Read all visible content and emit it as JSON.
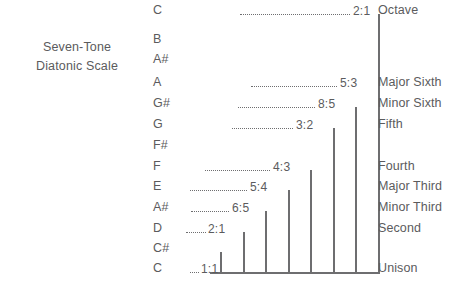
{
  "title": {
    "line1": "Seven-Tone",
    "line2": "Diatonic Scale"
  },
  "colors": {
    "ink": "#5b5b5d",
    "line": "#6e6e70",
    "background": "#ffffff"
  },
  "notes": [
    {
      "label": "C",
      "y": 14
    },
    {
      "label": "B",
      "y": 43
    },
    {
      "label": "A#",
      "y": 63
    },
    {
      "label": "A",
      "y": 86
    },
    {
      "label": "G#",
      "y": 107
    },
    {
      "label": "G",
      "y": 128
    },
    {
      "label": "F#",
      "y": 149
    },
    {
      "label": "F",
      "y": 170
    },
    {
      "label": "E",
      "y": 190
    },
    {
      "label": "A#",
      "y": 211
    },
    {
      "label": "D",
      "y": 232
    },
    {
      "label": "C#",
      "y": 252
    },
    {
      "label": "C",
      "y": 272
    }
  ],
  "intervals": [
    {
      "label": "Octave",
      "y": 14
    },
    {
      "label": "Major Sixth",
      "y": 86
    },
    {
      "label": "Minor Sixth",
      "y": 107
    },
    {
      "label": "Fifth",
      "y": 128
    },
    {
      "label": "Fourth",
      "y": 170
    },
    {
      "label": "Major Third",
      "y": 190
    },
    {
      "label": "Minor Third",
      "y": 211
    },
    {
      "label": "Second",
      "y": 232
    },
    {
      "label": "Unison",
      "y": 272
    }
  ],
  "chart_data": {
    "type": "bar",
    "title": "Seven-Tone Diatonic Scale",
    "xlabel": "",
    "ylabel": "",
    "orientation": "vertical",
    "baseline_y": 272,
    "categories": [
      "C",
      "D",
      "A#",
      "E",
      "F",
      "G",
      "G#",
      "A"
    ],
    "ratios": [
      "1:1",
      "2:1",
      "6:5",
      "5:4",
      "4:3",
      "3:2",
      "8:5",
      "5:3",
      "2:1"
    ],
    "intervals": [
      "Unison",
      "Second",
      "Minor Third",
      "Major Third",
      "Fourth",
      "Fifth",
      "Minor Sixth",
      "Major Sixth",
      "Octave"
    ],
    "bars": [
      {
        "note": "C#",
        "ratio": "1:1",
        "interval": "Unison",
        "x": 220,
        "top": 252
      },
      {
        "note": "D",
        "ratio": "2:1",
        "interval": "Second",
        "x": 243,
        "top": 232
      },
      {
        "note": "A#",
        "ratio": "6:5",
        "interval": "Minor Third",
        "x": 265,
        "top": 211
      },
      {
        "note": "E",
        "ratio": "5:4",
        "interval": "Major Third",
        "x": 288,
        "top": 190
      },
      {
        "note": "F",
        "ratio": "4:3",
        "interval": "Fourth",
        "x": 310,
        "top": 170
      },
      {
        "note": "G",
        "ratio": "3:2",
        "interval": "Fifth",
        "x": 333,
        "top": 128
      },
      {
        "note": "G#",
        "ratio": "8:5",
        "interval": "Minor Sixth",
        "x": 355,
        "top": 107
      },
      {
        "note": "A",
        "ratio": "5:3",
        "interval": "Major Sixth",
        "x": 378,
        "top": 86
      }
    ],
    "top_bar": {
      "note": "C",
      "ratio": "2:1",
      "interval": "Octave",
      "x": 378,
      "top": 14
    },
    "leaders": [
      {
        "ratio": "1:1",
        "y": 272,
        "x1": 190,
        "x2": 199,
        "label_x": 201
      },
      {
        "ratio": "2:1",
        "y": 232,
        "x1": 186,
        "x2": 206,
        "label_x": 208
      },
      {
        "ratio": "6:5",
        "y": 211,
        "x1": 191,
        "x2": 229,
        "label_x": 232
      },
      {
        "ratio": "5:4",
        "y": 190,
        "x1": 190,
        "x2": 247,
        "label_x": 250
      },
      {
        "ratio": "4:3",
        "y": 170,
        "x1": 205,
        "x2": 270,
        "label_x": 273
      },
      {
        "ratio": "3:2",
        "y": 128,
        "x1": 232,
        "x2": 293,
        "label_x": 296
      },
      {
        "ratio": "8:5",
        "y": 107,
        "x1": 238,
        "x2": 315,
        "label_x": 318
      },
      {
        "ratio": "5:3",
        "y": 86,
        "x1": 251,
        "x2": 337,
        "label_x": 340
      },
      {
        "ratio": "2:1",
        "y": 14,
        "x1": 240,
        "x2": 350,
        "label_x": 353
      }
    ]
  }
}
